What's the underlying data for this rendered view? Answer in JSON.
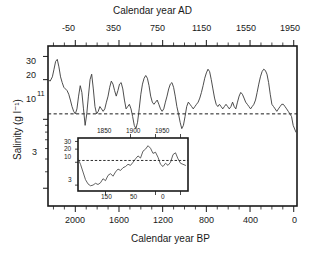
{
  "figure": {
    "top_axis_title": "Calendar year AD",
    "bottom_axis_title": "Calendar year BP",
    "y_axis_title": "Salinity (g l⁻¹)",
    "mean_annotation": "11"
  },
  "main_axis": {
    "top_ticks": [
      "-50",
      "350",
      "750",
      "1150",
      "1550",
      "1950"
    ],
    "bottom_ticks": [
      "2000",
      "1600",
      "1200",
      "800",
      "400",
      "0"
    ],
    "y_ticks": [
      "30",
      "20",
      "10",
      "3"
    ]
  },
  "inset_axis": {
    "top_ticks": [
      "1850",
      "1900",
      "1950"
    ],
    "bottom_ticks": [
      "150",
      "50",
      "0"
    ],
    "y_ticks": [
      "30",
      "20",
      "10",
      "3"
    ]
  },
  "chart_data": {
    "type": "line",
    "title": "",
    "xlabel": "Calendar year BP",
    "xlabel_secondary": "Calendar year AD",
    "ylabel": "Salinity (g l⁻¹)",
    "yscale": "log",
    "ylim": [
      2.2,
      36
    ],
    "y_ticks": [
      30,
      20,
      10,
      3
    ],
    "xlim_bp": [
      2250,
      -30
    ],
    "xlim_ad": [
      -300,
      1980
    ],
    "x_ticks_bp": [
      2000,
      1600,
      1200,
      800,
      400,
      0
    ],
    "x_ticks_ad": [
      -50,
      350,
      750,
      1150,
      1550,
      1950
    ],
    "x_direction": "reversed",
    "grid": false,
    "legend": false,
    "annotations": [
      {
        "text": "11",
        "value": 11,
        "type": "horizontal-dashed-line",
        "description": "long-term mean salinity reference line"
      }
    ],
    "series": [
      {
        "name": "Salinity reconstruction",
        "x_units": "Calendar year BP",
        "y_units": "g l-1",
        "x": [
          2250,
          2230,
          2210,
          2195,
          2180,
          2165,
          2150,
          2135,
          2120,
          2105,
          2090,
          2075,
          2060,
          2045,
          2030,
          2015,
          2000,
          1985,
          1970,
          1955,
          1940,
          1925,
          1910,
          1895,
          1880,
          1865,
          1850,
          1835,
          1820,
          1805,
          1790,
          1775,
          1760,
          1745,
          1730,
          1715,
          1700,
          1685,
          1670,
          1655,
          1640,
          1625,
          1610,
          1595,
          1580,
          1565,
          1550,
          1535,
          1520,
          1505,
          1490,
          1475,
          1460,
          1445,
          1430,
          1415,
          1400,
          1385,
          1370,
          1355,
          1340,
          1325,
          1310,
          1295,
          1280,
          1265,
          1250,
          1235,
          1220,
          1205,
          1190,
          1175,
          1160,
          1145,
          1130,
          1115,
          1100,
          1085,
          1070,
          1055,
          1040,
          1025,
          1010,
          995,
          980,
          965,
          950,
          935,
          920,
          905,
          890,
          875,
          860,
          845,
          830,
          815,
          800,
          785,
          770,
          755,
          740,
          725,
          710,
          695,
          680,
          665,
          650,
          635,
          620,
          605,
          590,
          575,
          560,
          545,
          530,
          515,
          500,
          485,
          470,
          455,
          440,
          425,
          410,
          395,
          380,
          365,
          350,
          335,
          320,
          305,
          290,
          275,
          260,
          245,
          230,
          215,
          200,
          185,
          170,
          155,
          140,
          125,
          110,
          95,
          80,
          65,
          50,
          35,
          20,
          5,
          -20
        ],
        "y": [
          20.0,
          19.5,
          21.0,
          24.0,
          27.5,
          28.5,
          25.0,
          21.0,
          19.0,
          17.5,
          17.0,
          16.5,
          15.5,
          14.0,
          12.5,
          11.5,
          11.0,
          12.0,
          15.0,
          18.0,
          16.0,
          12.0,
          9.0,
          11.0,
          15.0,
          20.0,
          22.0,
          17.0,
          12.5,
          11.0,
          11.5,
          12.5,
          12.0,
          11.5,
          12.0,
          13.5,
          15.0,
          17.5,
          19.5,
          18.5,
          16.5,
          15.0,
          16.5,
          18.5,
          19.0,
          17.0,
          14.0,
          12.0,
          12.5,
          13.0,
          12.0,
          10.5,
          9.0,
          8.5,
          9.5,
          12.0,
          15.5,
          18.5,
          20.5,
          21.5,
          20.5,
          18.0,
          15.0,
          13.5,
          13.0,
          13.5,
          14.0,
          13.0,
          12.0,
          11.5,
          12.0,
          13.5,
          15.0,
          17.0,
          18.5,
          19.0,
          17.5,
          15.0,
          12.5,
          11.0,
          9.5,
          8.5,
          9.0,
          10.5,
          12.5,
          13.5,
          13.0,
          12.5,
          12.0,
          12.5,
          13.0,
          13.5,
          14.5,
          16.0,
          18.0,
          20.5,
          22.5,
          24.0,
          23.0,
          20.0,
          17.0,
          14.5,
          13.0,
          12.5,
          13.0,
          12.5,
          12.0,
          12.5,
          13.0,
          12.5,
          12.0,
          12.5,
          13.5,
          12.5,
          12.0,
          13.5,
          15.0,
          16.0,
          15.5,
          14.5,
          13.5,
          13.0,
          12.5,
          12.0,
          12.5,
          13.0,
          14.0,
          16.0,
          18.5,
          21.0,
          23.0,
          24.0,
          23.5,
          22.0,
          19.0,
          15.5,
          13.0,
          12.5,
          12.0,
          11.5,
          12.0,
          12.5,
          13.0,
          13.0,
          12.5,
          12.0,
          11.5,
          11.0,
          10.5,
          9.0,
          8.0
        ]
      }
    ]
  },
  "inset_chart_data": {
    "type": "line",
    "yscale": "log",
    "ylim": [
      2.2,
      36
    ],
    "y_ticks": [
      30,
      20,
      10,
      3
    ],
    "xlim_bp": [
      205,
      -15
    ],
    "x_ticks_bp": [
      150,
      50,
      0
    ],
    "x_ticks_ad": [
      1850,
      1900,
      1950
    ],
    "x_direction": "reversed",
    "grid": false,
    "legend": false,
    "annotations": [
      {
        "text": "",
        "value": 11,
        "type": "horizontal-dashed-line"
      }
    ],
    "series": [
      {
        "name": "Salinity reconstruction (recent)",
        "x_units": "Calendar year BP",
        "y_units": "g l-1",
        "x": [
          205,
          200,
          195,
          190,
          185,
          180,
          175,
          170,
          165,
          160,
          155,
          150,
          145,
          140,
          135,
          130,
          125,
          120,
          115,
          110,
          105,
          100,
          95,
          90,
          85,
          80,
          75,
          70,
          65,
          60,
          55,
          50,
          45,
          40,
          35,
          30,
          25,
          20,
          15,
          10,
          5,
          0,
          -10
        ],
        "y": [
          12.0,
          9.0,
          6.0,
          4.0,
          3.2,
          2.9,
          3.0,
          3.3,
          3.1,
          3.4,
          4.2,
          3.8,
          5.0,
          5.5,
          4.8,
          6.0,
          7.0,
          6.5,
          7.5,
          8.0,
          9.0,
          8.5,
          10.0,
          12.0,
          14.0,
          12.5,
          18.0,
          20.0,
          24.0,
          21.0,
          16.0,
          17.0,
          13.0,
          9.0,
          8.0,
          9.5,
          8.5,
          10.0,
          15.0,
          16.5,
          12.0,
          9.5,
          8.5
        ]
      }
    ]
  }
}
